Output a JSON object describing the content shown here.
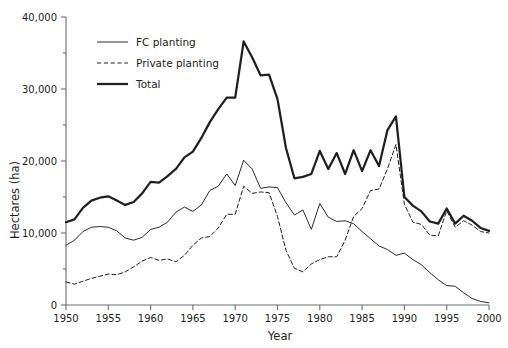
{
  "chart_data": {
    "type": "line",
    "title": "",
    "xlabel": "Year",
    "ylabel": "Hectares (ha)",
    "xlim": [
      1950,
      2000
    ],
    "ylim": [
      0,
      40000
    ],
    "grid": false,
    "legend_position": "top-left",
    "xticks": [
      1950,
      1955,
      1960,
      1965,
      1970,
      1975,
      1980,
      1985,
      1990,
      1995,
      2000
    ],
    "xtick_labels": [
      "1950",
      "1955",
      "1960",
      "1965",
      "1970",
      "1975",
      "1980",
      "1985",
      "1990",
      "1995",
      "2000"
    ],
    "yticks": [
      0,
      10000,
      20000,
      30000,
      40000
    ],
    "ytick_labels": [
      "0",
      "10,000",
      "20,000",
      "30,000",
      "40,000"
    ],
    "x": [
      1950,
      1951,
      1952,
      1953,
      1954,
      1955,
      1956,
      1957,
      1958,
      1959,
      1960,
      1961,
      1962,
      1963,
      1964,
      1965,
      1966,
      1967,
      1968,
      1969,
      1970,
      1971,
      1972,
      1973,
      1974,
      1975,
      1976,
      1977,
      1978,
      1979,
      1980,
      1981,
      1982,
      1983,
      1984,
      1985,
      1986,
      1987,
      1988,
      1989,
      1990,
      1991,
      1992,
      1993,
      1994,
      1995,
      1996,
      1997,
      1998,
      1999,
      2000
    ],
    "series": [
      {
        "name": "FC planting",
        "style": "solid-thin",
        "values": [
          8300,
          9000,
          10200,
          10800,
          10900,
          10800,
          10300,
          9300,
          9000,
          9400,
          10500,
          10800,
          11500,
          12900,
          13600,
          13000,
          13900,
          15900,
          16500,
          18200,
          16600,
          20100,
          18900,
          16200,
          16400,
          16300,
          14200,
          12500,
          13200,
          10500,
          14100,
          12200,
          11600,
          11700,
          11300,
          10200,
          9200,
          8200,
          7700,
          6900,
          7200,
          6300,
          5600,
          4500,
          3500,
          2700,
          2600,
          1700,
          900,
          500,
          300
        ]
      },
      {
        "name": "Private planting",
        "style": "dashed",
        "values": [
          3200,
          2900,
          3300,
          3700,
          4000,
          4300,
          4200,
          4600,
          5300,
          6100,
          6600,
          6200,
          6400,
          6000,
          6900,
          8300,
          9300,
          9500,
          10700,
          12600,
          12600,
          16500,
          15500,
          15700,
          15600,
          12300,
          7600,
          5100,
          4600,
          5700,
          6300,
          6700,
          6700,
          9000,
          12300,
          13400,
          15900,
          16100,
          18900,
          22300,
          14000,
          11500,
          11200,
          9700,
          9600,
          13100,
          10800,
          11700,
          11100,
          10200,
          10000
        ]
      },
      {
        "name": "Total",
        "style": "solid-thick",
        "values": [
          11500,
          11900,
          13500,
          14500,
          14900,
          15100,
          14500,
          13900,
          14300,
          15500,
          17100,
          17000,
          17900,
          18900,
          20500,
          21300,
          23200,
          25400,
          27200,
          28800,
          28800,
          36600,
          34400,
          31900,
          32000,
          28600,
          21800,
          17600,
          17800,
          18200,
          21400,
          18900,
          21100,
          18200,
          21500,
          18600,
          21500,
          19300,
          24300,
          26200,
          15000,
          13800,
          13000,
          11600,
          11300,
          13400,
          11300,
          12400,
          11700,
          10700,
          10300
        ]
      }
    ],
    "legend_entries": [
      {
        "label": "FC planting",
        "style": "solid-thin"
      },
      {
        "label": "Private planting",
        "style": "dashed"
      },
      {
        "label": "Total",
        "style": "solid-thick"
      }
    ]
  }
}
